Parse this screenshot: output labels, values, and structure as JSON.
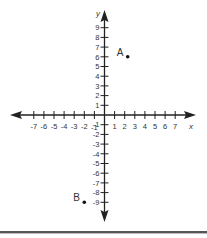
{
  "chart_data": {
    "type": "scatter",
    "title": "",
    "xlabel": "x",
    "ylabel": "y",
    "xlim": [
      -8,
      8
    ],
    "ylim": [
      -10,
      10
    ],
    "grid": false,
    "x_ticks": [
      -7,
      -6,
      -5,
      -4,
      -3,
      -2,
      -1,
      1,
      2,
      3,
      4,
      5,
      6,
      7
    ],
    "y_ticks": [
      9,
      8,
      7,
      6,
      5,
      4,
      3,
      2,
      1,
      -1,
      -2,
      -3,
      -4,
      -5,
      -6,
      -7,
      -8,
      -9
    ],
    "points": [
      {
        "label": "A",
        "x": 2,
        "y": 6
      },
      {
        "label": "B",
        "x": -2,
        "y": -9
      }
    ]
  },
  "colors": {
    "axis": "#222222",
    "text": "#333333",
    "point": "#111111"
  }
}
